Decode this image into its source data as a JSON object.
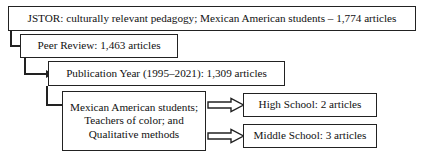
{
  "diagram": {
    "stroke_color": "#222222",
    "background_color": "#ffffff",
    "nodes": {
      "search": {
        "label": "JSTOR: culturally relevant pedagogy; Mexican American students – 1,774 articles",
        "stage": "Database search",
        "count": "1,774"
      },
      "peer_review": {
        "label": "Peer Review: 1,463 articles",
        "stage": "Peer review filter",
        "count": "1,463"
      },
      "publication_year": {
        "label": "Publication Year (1995–2021): 1,309 articles",
        "stage": "Publication year filter",
        "count": "1,309"
      },
      "criteria": {
        "line1": "Mexican American students;",
        "line2": "Teachers of color; and",
        "line3": "Qualitative methods",
        "stage": "Inclusion criteria"
      },
      "high_school": {
        "label": "High School: 2 articles",
        "stage": "Included – high school",
        "count": "2"
      },
      "middle_school": {
        "label": "Middle School: 3 articles",
        "stage": "Included – middle school",
        "count": "3"
      }
    },
    "connectors": {
      "search_to_peer": "elbow-arrow-down-right",
      "peer_to_year": "elbow-arrow-down-right",
      "year_to_criteria": "elbow-arrow-down-right",
      "criteria_to_high": "block-arrow-right",
      "criteria_to_middle": "block-arrow-right"
    }
  }
}
